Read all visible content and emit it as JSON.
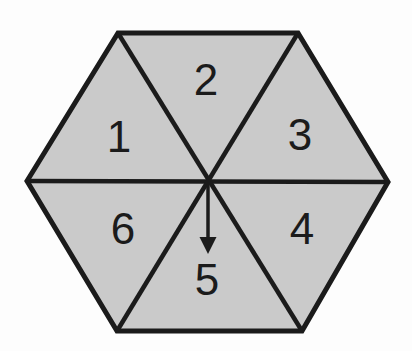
{
  "figure": {
    "type": "hexagon divided into six triangular sectors",
    "sectors": [
      {
        "label": "1",
        "position": "upper-left"
      },
      {
        "label": "2",
        "position": "top"
      },
      {
        "label": "3",
        "position": "upper-right"
      },
      {
        "label": "4",
        "position": "lower-right"
      },
      {
        "label": "5",
        "position": "bottom"
      },
      {
        "label": "6",
        "position": "lower-left"
      }
    ],
    "arrow": {
      "direction": "down",
      "points_to_sector": "5"
    },
    "colors": {
      "fill": "#cacaca",
      "outline": "#1b1b1b",
      "text": "#1b1b1b",
      "background": "#fdfdfd"
    }
  }
}
